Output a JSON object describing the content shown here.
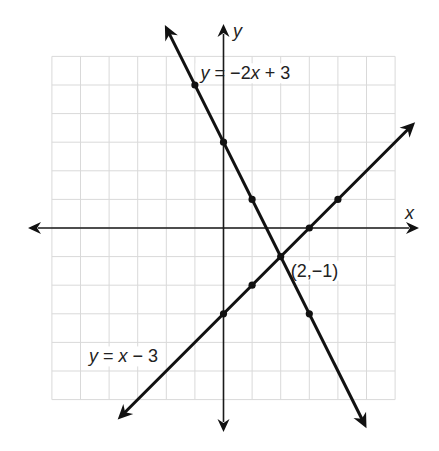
{
  "chart_data": {
    "type": "line",
    "title": "",
    "xlabel": "x",
    "ylabel": "y",
    "xlim": [
      -6,
      6
    ],
    "ylim": [
      -6,
      6
    ],
    "grid": true,
    "grid_step": 1,
    "series": [
      {
        "name": "y = -2x + 3",
        "slope": -2,
        "intercept": 3,
        "x_range": [
          -2.05,
          5
        ],
        "points": [
          [
            -1,
            5
          ],
          [
            0,
            3
          ],
          [
            1,
            1
          ],
          [
            3,
            -3
          ]
        ],
        "label": {
          "parts": [
            {
              "t": "y",
              "i": true
            },
            {
              "t": " = −2",
              "i": false
            },
            {
              "t": "x",
              "i": true
            },
            {
              "t": " + 3",
              "i": false
            }
          ],
          "anchor": [
            -0.8,
            5.2
          ]
        }
      },
      {
        "name": "y = x - 3",
        "slope": 1,
        "intercept": -3,
        "x_range": [
          -3.7,
          6.7
        ],
        "points": [
          [
            0,
            -3
          ],
          [
            1,
            -2
          ],
          [
            3,
            0
          ],
          [
            4,
            1
          ]
        ],
        "label": {
          "parts": [
            {
              "t": "y",
              "i": true
            },
            {
              "t": " = ",
              "i": false
            },
            {
              "t": "x",
              "i": true
            },
            {
              "t": " − 3",
              "i": false
            }
          ],
          "anchor": [
            -4.7,
            -4.7
          ]
        }
      }
    ],
    "annotations": [
      {
        "text": "(2,−1)",
        "point": [
          2,
          -1
        ],
        "anchor": [
          2.35,
          -1.7
        ]
      }
    ],
    "axis_labels": {
      "x": "x",
      "y": "y"
    }
  },
  "colors": {
    "line": "#111111",
    "grid": "#d9d9d9",
    "background": "#ffffff"
  }
}
